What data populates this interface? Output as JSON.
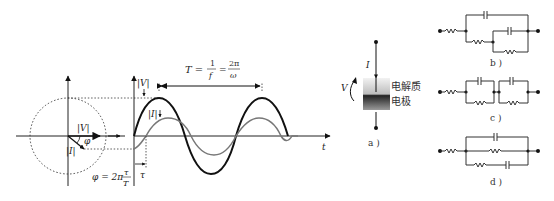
{
  "phasor": {
    "v_label": "|V|",
    "i_label": "|I|",
    "phi_label": "φ",
    "phase_formula": {
      "lhs": "φ = 2π",
      "num": "τ",
      "den": "T"
    }
  },
  "waveform": {
    "v_amp_label": "|V|",
    "i_amp_label": "|I|",
    "period_formula": {
      "lhs": "T =",
      "f1_num": "1",
      "f1_den": "f",
      "eq": "=",
      "f2_num": "2π",
      "f2_den": "ω"
    },
    "tau_label": "τ",
    "t_axis_label": "t",
    "colors": {
      "voltage": "#111111",
      "current": "#777777"
    }
  },
  "cell": {
    "current_label": "I",
    "voltage_label": "V",
    "electrolyte_label": "电解质",
    "electrode_label": "电极",
    "caption": "a )"
  },
  "circuits": {
    "b_caption": "b )",
    "c_caption": "c )",
    "d_caption": "d )"
  }
}
